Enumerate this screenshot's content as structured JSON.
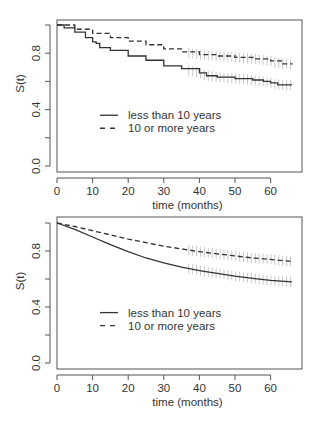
{
  "chart_data": [
    {
      "type": "line",
      "title": "",
      "xlabel": "time (months)",
      "ylabel": "S(t)",
      "xlim": [
        0,
        67
      ],
      "ylim": [
        0,
        1
      ],
      "x_ticks": [
        0,
        10,
        20,
        30,
        40,
        50,
        60
      ],
      "y_ticks": [
        0.0,
        0.2,
        0.4,
        0.6,
        0.8,
        1.0
      ],
      "y_tick_labels": [
        "0.0",
        "",
        "0.4",
        "",
        "0.8",
        ""
      ],
      "grid": false,
      "legend_position": "center-left",
      "series": [
        {
          "name": "less than 10 years",
          "style": "solid",
          "x": [
            0,
            2,
            5,
            8,
            10,
            11,
            12,
            15,
            20,
            25,
            30,
            35,
            40,
            42,
            45,
            50,
            55,
            58,
            60,
            62,
            66
          ],
          "values": [
            1.0,
            0.98,
            0.95,
            0.91,
            0.88,
            0.87,
            0.84,
            0.82,
            0.78,
            0.75,
            0.71,
            0.69,
            0.66,
            0.64,
            0.63,
            0.62,
            0.61,
            0.6,
            0.59,
            0.575,
            0.575
          ]
        },
        {
          "name": "10 or more years",
          "style": "dashed",
          "x": [
            0,
            5,
            10,
            15,
            20,
            25,
            30,
            35,
            40,
            45,
            50,
            55,
            60,
            63,
            66
          ],
          "values": [
            1.0,
            0.97,
            0.94,
            0.91,
            0.885,
            0.86,
            0.83,
            0.81,
            0.79,
            0.78,
            0.77,
            0.76,
            0.745,
            0.725,
            0.72
          ]
        }
      ],
      "censoring_band_x_range": [
        37,
        66
      ]
    },
    {
      "type": "line",
      "title": "",
      "xlabel": "time (months)",
      "ylabel": "S(t)",
      "xlim": [
        0,
        67
      ],
      "ylim": [
        0,
        1
      ],
      "x_ticks": [
        0,
        10,
        20,
        30,
        40,
        50,
        60
      ],
      "y_ticks": [
        0.0,
        0.2,
        0.4,
        0.6,
        0.8,
        1.0
      ],
      "y_tick_labels": [
        "0.0",
        "",
        "0.4",
        "",
        "0.8",
        ""
      ],
      "grid": false,
      "legend_position": "center-left",
      "series": [
        {
          "name": "less than 10 years",
          "style": "solid",
          "x": [
            0,
            5,
            10,
            15,
            20,
            25,
            30,
            35,
            40,
            45,
            50,
            55,
            60,
            66
          ],
          "values": [
            1.0,
            0.955,
            0.9,
            0.845,
            0.795,
            0.75,
            0.715,
            0.685,
            0.66,
            0.64,
            0.62,
            0.605,
            0.59,
            0.58
          ]
        },
        {
          "name": "10 or more years",
          "style": "dashed",
          "x": [
            0,
            5,
            10,
            15,
            20,
            25,
            30,
            35,
            40,
            45,
            50,
            55,
            60,
            66
          ],
          "values": [
            1.0,
            0.975,
            0.945,
            0.915,
            0.885,
            0.86,
            0.835,
            0.815,
            0.795,
            0.78,
            0.765,
            0.75,
            0.74,
            0.725
          ]
        }
      ],
      "censoring_band_x_range": [
        37,
        66
      ]
    }
  ],
  "colors": {
    "axis": "#555555",
    "curve": "#333333",
    "censor_marks": "#bbbbbb",
    "text": "#333333"
  }
}
